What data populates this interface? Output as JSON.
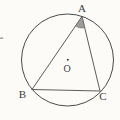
{
  "diagram": {
    "type": "geometry-circle-inscribed-triangle",
    "canvas": {
      "width": 120,
      "height": 120
    },
    "colors": {
      "background": "#fcfbf8",
      "line": "#4b4b4b",
      "label": "#3d3d3d",
      "shaded_angle_fill": "#9c9c9c",
      "shaded_angle_stroke": "#5a5a5a",
      "artifact": "#8a8a8a"
    },
    "circle": {
      "cx": 67.5,
      "cy": 60,
      "r": 46,
      "stroke_width": 1
    },
    "center_point": {
      "label": "O",
      "dot_x": 67.8,
      "dot_y": 59.8,
      "dot_r": 1.0,
      "label_x": 67,
      "label_y": 71.5,
      "font_size": 10
    },
    "vertices": [
      {
        "label": "A",
        "x": 82,
        "y": 16.5,
        "label_x": 82,
        "label_y": 11.5,
        "font_size": 11
      },
      {
        "label": "B",
        "x": 32,
        "y": 89.5,
        "label_x": 22.4,
        "label_y": 98,
        "font_size": 11
      },
      {
        "label": "C",
        "x": 100,
        "y": 91,
        "label_x": 102.8,
        "label_y": 99.5,
        "font_size": 11
      }
    ],
    "sides": [
      {
        "name": "side-AB",
        "from": "A",
        "to": "B",
        "stroke_width": 0.9
      },
      {
        "name": "side-AC",
        "from": "A",
        "to": "C",
        "stroke_width": 0.9
      },
      {
        "name": "side-BC",
        "from": "B",
        "to": "C",
        "stroke_width": 0.9
      }
    ],
    "shaded_angle": {
      "vertex": "A",
      "radius": 11.5
    },
    "edge_artifact": {
      "x": 0,
      "y": 37.6,
      "width": 3.2,
      "height": 1.2
    }
  }
}
